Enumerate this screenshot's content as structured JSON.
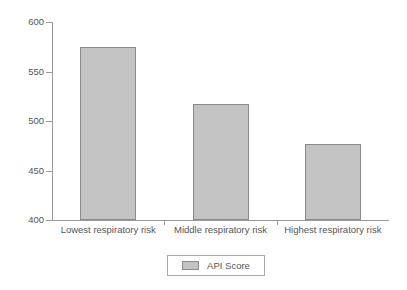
{
  "chart_data": {
    "type": "bar",
    "title": "",
    "subtitle": "",
    "xlabel": "",
    "ylabel": "",
    "categories": [
      "Lowest respiratory risk",
      "Middle respiratory risk",
      "Highest respiratory risk"
    ],
    "series": [
      {
        "name": "API Score",
        "values": [
          575,
          517,
          477
        ],
        "color": "#c3c3c3",
        "border_color": "#8b8b8b"
      }
    ],
    "ylim": [
      400,
      600
    ],
    "yticks": [
      400,
      450,
      500,
      550,
      600
    ],
    "ytick_labels": [
      "400",
      "450",
      "500",
      "550",
      "600"
    ],
    "grid": false,
    "legend_position": "bottom-center",
    "legend_entries": [
      {
        "label": "API Score",
        "color": "#c3c3c3"
      }
    ],
    "annotations": [],
    "axis_color": "#9a9a9a",
    "text_color": "#555555",
    "background": "#ffffff"
  }
}
